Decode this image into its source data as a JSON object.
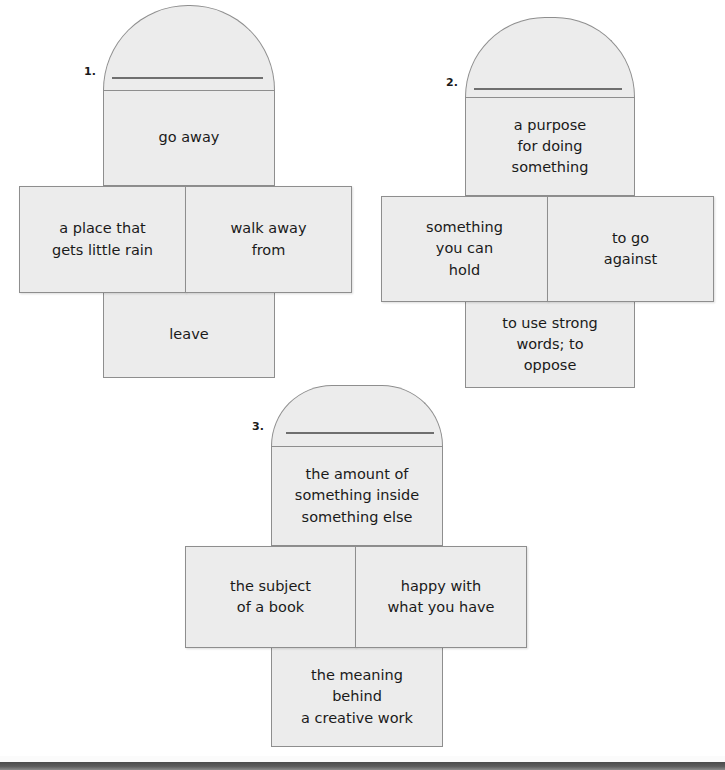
{
  "page": {
    "type": "vocabulary-foldable-worksheet",
    "background_color": "#ffffff",
    "panel_fill_color": "#ececec",
    "panel_border_color": "#8e8e8e",
    "text_color": "#1a1a1a",
    "scan_edge_color": "#4b4b4b"
  },
  "foldables": [
    {
      "number": "1.",
      "arch_blank_line": "",
      "top_panel": "go away",
      "left_panel": "a place that\ngets little rain",
      "right_panel": "walk away\nfrom",
      "bottom_panel": "leave",
      "top_lines": [
        "go away"
      ],
      "left_lines": [
        "a place that",
        "gets little rain"
      ],
      "right_lines": [
        "walk away",
        "from"
      ],
      "bottom_lines": [
        "leave"
      ]
    },
    {
      "number": "2.",
      "arch_blank_line": "",
      "top_panel": "a purpose\nfor doing\nsomething",
      "left_panel": "something\nyou can\nhold",
      "right_panel": "to go\nagainst",
      "bottom_panel": "to use strong\nwords; to\noppose",
      "top_lines": [
        "a purpose",
        "for doing",
        "something"
      ],
      "left_lines": [
        "something",
        "you can",
        "hold"
      ],
      "right_lines": [
        "to go",
        "against"
      ],
      "bottom_lines": [
        "to use strong",
        "words; to",
        "oppose"
      ]
    },
    {
      "number": "3.",
      "arch_blank_line": "",
      "top_panel": "the amount of\nsomething inside\nsomething else",
      "left_panel": "the subject\nof a book",
      "right_panel": "happy with\nwhat you have",
      "bottom_panel": "the meaning\nbehind\na creative work",
      "top_lines": [
        "the amount of",
        "something inside",
        "something else"
      ],
      "left_lines": [
        "the subject",
        "of a book"
      ],
      "right_lines": [
        "happy with",
        "what you have"
      ],
      "bottom_lines": [
        "the meaning",
        "behind",
        "a creative work"
      ]
    }
  ]
}
